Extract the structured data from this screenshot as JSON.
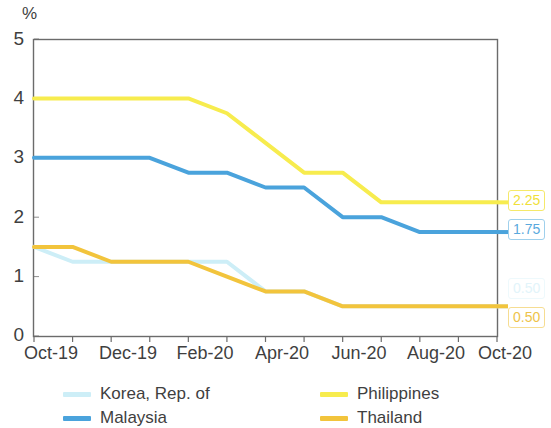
{
  "axis": {
    "unit": "%",
    "y_ticks": [
      "0",
      "1",
      "2",
      "3",
      "4",
      "5"
    ],
    "x_ticks": [
      "Oct-19",
      "Dec-19",
      "Feb-20",
      "Apr-20",
      "Jun-20",
      "Aug-20",
      "Oct-20"
    ]
  },
  "colors": {
    "korea": "#cdeef7",
    "malaysia": "#4aa3dc",
    "philippines": "#f7ec4e",
    "thailand": "#f2c43c",
    "axis": "#6b6b6b",
    "text": "#3f3f3f"
  },
  "legend": [
    {
      "label": "Korea, Rep. of",
      "color": "#cdeef7"
    },
    {
      "label": "Malaysia",
      "color": "#4aa3dc"
    },
    {
      "label": "Philippines",
      "color": "#f7ec4e"
    },
    {
      "label": "Thailand",
      "color": "#f2c43c"
    }
  ],
  "end_labels": [
    {
      "value": "2.25",
      "color": "#f7ec4e",
      "series": "Philippines"
    },
    {
      "value": "1.75",
      "color": "#4aa3dc",
      "series": "Malaysia"
    },
    {
      "value": "0.50",
      "color": "#cdeef7",
      "series": "Korea, Rep. of"
    },
    {
      "value": "0.50",
      "color": "#f2c43c",
      "series": "Thailand"
    }
  ],
  "chart_data": {
    "type": "line",
    "title": "",
    "xlabel": "",
    "ylabel": "%",
    "ylim": [
      0,
      5
    ],
    "yticks": [
      0,
      1,
      2,
      3,
      4,
      5
    ],
    "grid": false,
    "legend_position": "bottom",
    "x": [
      "Oct-19",
      "Nov-19",
      "Dec-19",
      "Jan-20",
      "Feb-20",
      "Mar-20",
      "Apr-20",
      "May-20",
      "Jun-20",
      "Jul-20",
      "Aug-20",
      "Sep-20",
      "Oct-20"
    ],
    "xticks": [
      "Oct-19",
      "Dec-19",
      "Feb-20",
      "Apr-20",
      "Jun-20",
      "Aug-20",
      "Oct-20"
    ],
    "series": [
      {
        "name": "Korea, Rep. of",
        "color": "#cdeef7",
        "values": [
          1.5,
          1.25,
          1.25,
          1.25,
          1.25,
          1.25,
          0.75,
          0.75,
          0.5,
          0.5,
          0.5,
          0.5,
          0.5
        ],
        "end_value": 0.5
      },
      {
        "name": "Malaysia",
        "color": "#4aa3dc",
        "values": [
          3.0,
          3.0,
          3.0,
          3.0,
          2.75,
          2.75,
          2.5,
          2.5,
          2.0,
          2.0,
          1.75,
          1.75,
          1.75
        ],
        "end_value": 1.75
      },
      {
        "name": "Philippines",
        "color": "#f7ec4e",
        "values": [
          4.0,
          4.0,
          4.0,
          4.0,
          4.0,
          3.75,
          3.25,
          2.75,
          2.75,
          2.25,
          2.25,
          2.25,
          2.25
        ],
        "end_value": 2.25
      },
      {
        "name": "Thailand",
        "color": "#f2c43c",
        "values": [
          1.5,
          1.5,
          1.25,
          1.25,
          1.25,
          1.0,
          0.75,
          0.75,
          0.5,
          0.5,
          0.5,
          0.5,
          0.5
        ],
        "end_value": 0.5
      }
    ]
  }
}
